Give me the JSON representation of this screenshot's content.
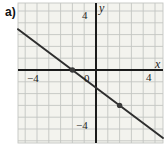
{
  "colors": {
    "axis": "#1b1b1b",
    "grid_line": "#c3c5c2",
    "grid_bg": "#f3f3ee",
    "line": "#2e2e2e",
    "point": "#3a3a3a",
    "text": "#1d1d1d"
  },
  "chart_data": {
    "type": "line",
    "panel_label": "a)",
    "title": "",
    "grid": true,
    "axes": {
      "x": {
        "label": "x",
        "ticks_labeled": [
          -4,
          4
        ],
        "visible_range": [
          -6.6,
          5.7
        ]
      },
      "y": {
        "label": "y",
        "ticks_labeled": [
          4,
          -4
        ],
        "visible_range": [
          -6.2,
          5.7
        ]
      }
    },
    "tick_label_strings": {
      "x_left": "−4",
      "x_right": "4",
      "y_top": "4",
      "y_bottom": "−4",
      "origin": "0"
    },
    "line": {
      "equation": "y = -0.75x - 1.5",
      "slope": -0.75,
      "y_intercept": -1.5,
      "marked_points": [
        {
          "x": -2,
          "y": 0
        },
        {
          "x": 2,
          "y": -3
        }
      ]
    }
  }
}
